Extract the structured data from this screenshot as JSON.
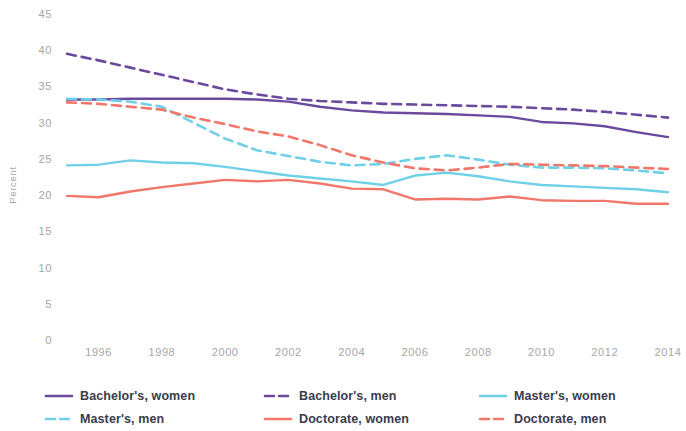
{
  "chart_data": {
    "type": "line",
    "title": "",
    "subtitle": "",
    "xlabel": "",
    "ylabel": "Percent",
    "xlim": [
      1995,
      2014
    ],
    "ylim": [
      0,
      45
    ],
    "grid": false,
    "legend_position": "bottom",
    "x": [
      1995,
      1996,
      1997,
      1998,
      1999,
      2000,
      2001,
      2002,
      2003,
      2004,
      2005,
      2006,
      2007,
      2008,
      2009,
      2010,
      2011,
      2012,
      2013,
      2014
    ],
    "xticks": [
      "1996",
      "1998",
      "2000",
      "2002",
      "2004",
      "2006",
      "2008",
      "2010",
      "2012",
      "2014"
    ],
    "xtick_values": [
      1996,
      1998,
      2000,
      2002,
      2004,
      2006,
      2008,
      2010,
      2012,
      2014
    ],
    "yticks": [
      "0",
      "5",
      "10",
      "15",
      "20",
      "25",
      "30",
      "35",
      "40",
      "45"
    ],
    "ytick_values": [
      0,
      5,
      10,
      15,
      20,
      25,
      30,
      35,
      40,
      45
    ],
    "series": [
      {
        "name": "Bachelor's, women",
        "color": "#6b4a9e",
        "style": "solid",
        "values": [
          33.2,
          33.2,
          33.3,
          33.3,
          33.3,
          33.3,
          33.2,
          32.9,
          32.2,
          31.7,
          31.4,
          31.3,
          31.2,
          31.0,
          30.8,
          30.1,
          29.9,
          29.5,
          28.7,
          28.0
        ]
      },
      {
        "name": "Bachelor's, men",
        "color": "#6b4a9e",
        "style": "dashed",
        "values": [
          39.5,
          38.6,
          37.6,
          36.6,
          35.6,
          34.6,
          33.9,
          33.3,
          33.0,
          32.8,
          32.6,
          32.5,
          32.4,
          32.3,
          32.2,
          32.0,
          31.8,
          31.5,
          31.1,
          30.7
        ]
      },
      {
        "name": "Master's, women",
        "color": "#6fd0e8",
        "style": "solid",
        "values": [
          24.1,
          24.2,
          24.8,
          24.5,
          24.4,
          23.9,
          23.3,
          22.7,
          22.3,
          21.9,
          21.4,
          22.7,
          23.1,
          22.6,
          21.9,
          21.4,
          21.2,
          21.0,
          20.8,
          20.4
        ]
      },
      {
        "name": "Master's, men",
        "color": "#6fd0e8",
        "style": "dashed",
        "values": [
          33.3,
          33.2,
          32.9,
          32.2,
          30.0,
          27.8,
          26.2,
          25.4,
          24.6,
          24.1,
          24.3,
          25.0,
          25.5,
          24.9,
          24.2,
          23.8,
          23.8,
          23.7,
          23.4,
          23.0
        ]
      },
      {
        "name": "Doctorate, women",
        "color": "#f0776a",
        "style": "solid",
        "values": [
          19.9,
          19.7,
          20.5,
          21.1,
          21.6,
          22.1,
          21.9,
          22.1,
          21.6,
          20.9,
          20.8,
          19.4,
          19.5,
          19.4,
          19.8,
          19.3,
          19.2,
          19.2,
          18.8,
          18.8
        ]
      },
      {
        "name": "Doctorate, men",
        "color": "#f0776a",
        "style": "dashed",
        "values": [
          32.8,
          32.6,
          32.2,
          31.8,
          30.7,
          29.8,
          28.8,
          28.1,
          26.9,
          25.5,
          24.5,
          23.7,
          23.4,
          23.8,
          24.3,
          24.2,
          24.1,
          24.0,
          23.8,
          23.6
        ]
      }
    ]
  },
  "legend": {
    "items": [
      {
        "label": "Bachelor's, women",
        "color": "#6b4a9e",
        "style": "solid"
      },
      {
        "label": "Bachelor's, men",
        "color": "#6b4a9e",
        "style": "dashed"
      },
      {
        "label": "Master's, women",
        "color": "#6fd0e8",
        "style": "solid"
      },
      {
        "label": "Master's, men",
        "color": "#6fd0e8",
        "style": "dashed"
      },
      {
        "label": "Doctorate, women",
        "color": "#f0776a",
        "style": "solid"
      },
      {
        "label": "Doctorate, men",
        "color": "#f0776a",
        "style": "dashed"
      }
    ]
  },
  "colors": {
    "background": "#ffffff",
    "tick_text": "#a6a6a6",
    "legend_text": "#3b3b4d",
    "bachelor": "#6b4a9e",
    "master": "#6fd0e8",
    "doctorate": "#f0776a"
  }
}
